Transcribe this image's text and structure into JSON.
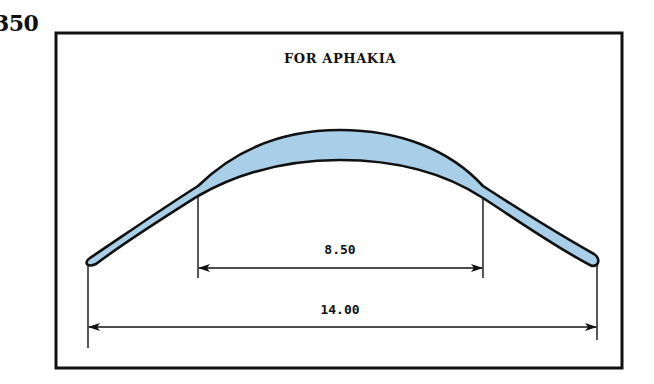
{
  "page": {
    "number_fragment": "350"
  },
  "figure": {
    "title": "FOR APHAKIA",
    "lens_fill_color": "#a9cfe8",
    "outline_color": "#111111",
    "dimensions": {
      "optic_zone": {
        "label": "8.50",
        "value": 8.5
      },
      "overall_diameter": {
        "label": "14.00",
        "value": 14.0
      }
    }
  }
}
